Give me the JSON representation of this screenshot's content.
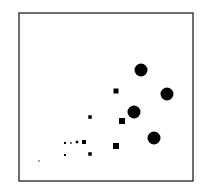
{
  "chart_data": {
    "type": "scatter",
    "title": "",
    "xlabel": "",
    "ylabel": "",
    "grid": false,
    "legend": null,
    "frame": {
      "x": 19,
      "y": 13,
      "width": 174,
      "height": 168,
      "stroke": "#222222",
      "stroke_width": 1.3
    },
    "marker_color": "#000000",
    "series": [
      {
        "name": "circles",
        "marker": "circle",
        "points": [
          {
            "x": 141,
            "y": 70,
            "r": 6.5
          },
          {
            "x": 167,
            "y": 94,
            "r": 6.5
          },
          {
            "x": 134,
            "y": 112,
            "r": 6.5
          },
          {
            "x": 154,
            "y": 138,
            "r": 6.5
          }
        ]
      },
      {
        "name": "squares",
        "marker": "square",
        "points": [
          {
            "x": 116,
            "y": 91,
            "s": 5
          },
          {
            "x": 122,
            "y": 121,
            "s": 6
          },
          {
            "x": 116,
            "y": 146,
            "s": 6
          },
          {
            "x": 90,
            "y": 117,
            "s": 3.5
          },
          {
            "x": 84,
            "y": 142,
            "s": 4
          },
          {
            "x": 77,
            "y": 142,
            "s": 2.5
          },
          {
            "x": 71,
            "y": 143,
            "s": 1.5
          },
          {
            "x": 65,
            "y": 143,
            "s": 2
          },
          {
            "x": 90,
            "y": 154,
            "s": 3.5
          },
          {
            "x": 65,
            "y": 155,
            "s": 2
          },
          {
            "x": 39,
            "y": 161,
            "s": 1.2
          }
        ]
      }
    ]
  }
}
